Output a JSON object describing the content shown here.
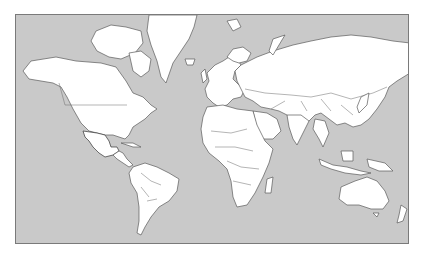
{
  "map": {
    "type": "world-political-outline",
    "projection": "mercator",
    "colors": {
      "ocean": "#c9c9c9",
      "land": "#ffffff",
      "highlight": "#565656",
      "outline": "#5a5a5a",
      "frame": "#7a7a7a"
    },
    "highlighted_regions": [
      "Mexico"
    ]
  }
}
